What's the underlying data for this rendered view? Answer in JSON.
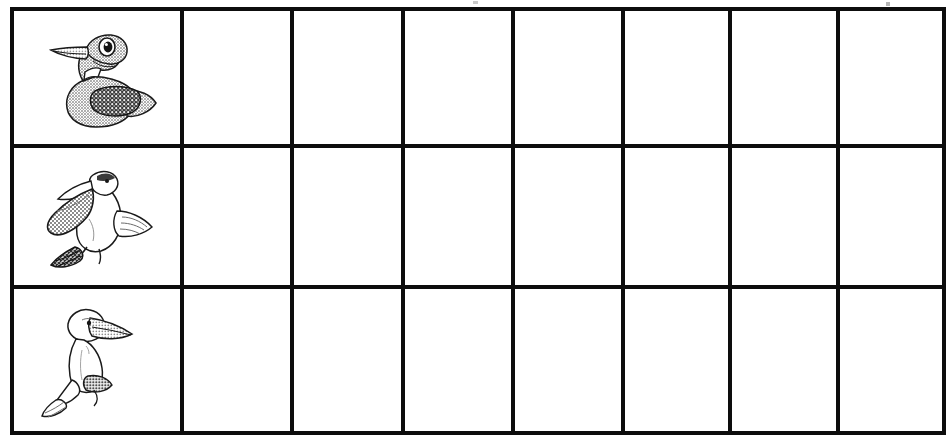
{
  "worksheet": {
    "page_background": "#ffffff",
    "ink_color": "#0d0d0d",
    "grid": {
      "rows": 3,
      "columns": 8,
      "column_roles": [
        "picture",
        "blank",
        "blank",
        "blank",
        "blank",
        "blank",
        "blank",
        "blank"
      ]
    },
    "rows": [
      {
        "row_label": "row-1",
        "picture": {
          "icon_name": "loon-bird-illustration",
          "alt_text": "Loon",
          "body_fill": "#a9a9a9",
          "wing_fill": "#3b3b3b",
          "outline": "#1a1a1a"
        },
        "answers": [
          "",
          "",
          "",
          "",
          "",
          "",
          ""
        ]
      },
      {
        "row_label": "row-2",
        "picture": {
          "icon_name": "pelican-bird-illustration",
          "alt_text": "Pelican",
          "body_fill": "#ffffff",
          "pouch_fill": "#9a9a9a",
          "feet_fill": "#4a4a4a",
          "outline": "#1a1a1a"
        },
        "answers": [
          "",
          "",
          "",
          "",
          "",
          "",
          ""
        ]
      },
      {
        "row_label": "row-3",
        "picture": {
          "icon_name": "booby-bird-illustration",
          "alt_text": "Booby",
          "body_fill": "#ffffff",
          "beak_fill": "#b4b4b4",
          "tail_fill": "#6e6e6e",
          "outline": "#1a1a1a"
        },
        "answers": [
          "",
          "",
          "",
          "",
          "",
          "",
          ""
        ]
      }
    ]
  }
}
